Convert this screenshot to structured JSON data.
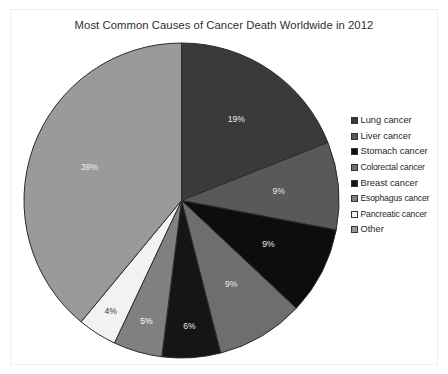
{
  "chart": {
    "title": "Most Common Causes of Cancer Death Worldwide in 2012",
    "background": "#ffffff",
    "border_color": "#f0f0f0"
  },
  "legend": {
    "position": "right",
    "items": [
      {
        "label": "Lung cancer",
        "color": "#3a3a3a",
        "swatch_name": "legend-swatch-lung"
      },
      {
        "label": "Liver cancer",
        "color": "#595959",
        "swatch_name": "legend-swatch-liver"
      },
      {
        "label": "Stomach cancer",
        "color": "#0d0d0d",
        "swatch_name": "legend-swatch-stomach"
      },
      {
        "label": "Colorectal cancer",
        "color": "#6e6e6e",
        "swatch_name": "legend-swatch-colorectal"
      },
      {
        "label": "Breast cancer",
        "color": "#151515",
        "swatch_name": "legend-swatch-breast"
      },
      {
        "label": "Esophagus cancer",
        "color": "#808080",
        "swatch_name": "legend-swatch-esophagus"
      },
      {
        "label": "Pancreatic cancer",
        "color": "#f2f2f2",
        "swatch_name": "legend-swatch-pancreatic"
      },
      {
        "label": "Other",
        "color": "#9a9a9a",
        "swatch_name": "legend-swatch-other"
      }
    ]
  },
  "chart_data": {
    "type": "pie",
    "title": "Most Common Causes of Cancer Death Worldwide in 2012",
    "xlabel": "",
    "ylabel": "",
    "grid": false,
    "legend_position": "right",
    "start_angle_deg": 0,
    "direction": "clockwise",
    "categories": [
      "Lung cancer",
      "Liver cancer",
      "Stomach cancer",
      "Colorectal cancer",
      "Breast cancer",
      "Esophagus cancer",
      "Pancreatic cancer",
      "Other"
    ],
    "values": [
      19,
      9,
      9,
      9,
      6,
      5,
      4,
      39
    ],
    "value_labels": [
      "19%",
      "9%",
      "9%",
      "9%",
      "6%",
      "5%",
      "4%",
      "39%"
    ],
    "colors": [
      "#3a3a3a",
      "#595959",
      "#0d0d0d",
      "#6e6e6e",
      "#151515",
      "#808080",
      "#f2f2f2",
      "#9a9a9a"
    ],
    "label_colors": [
      "#e8e8e8",
      "#e8e8e8",
      "#e8e8e8",
      "#e8e8e8",
      "#e8e8e8",
      "#ffffff",
      "#3a3a3a",
      "#f2f2f2"
    ],
    "units": "percent",
    "total": 100
  }
}
